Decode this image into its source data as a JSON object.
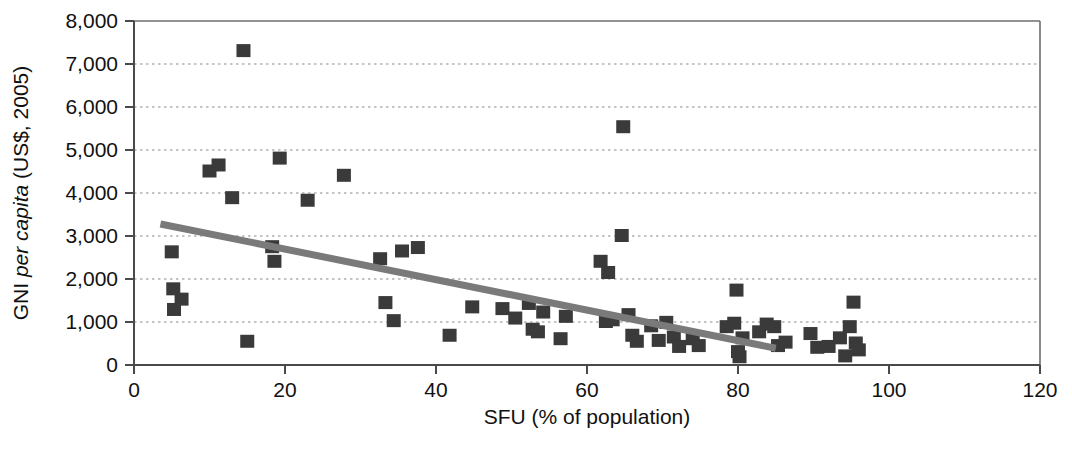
{
  "chart_data": {
    "type": "scatter",
    "title": "",
    "xlabel": "SFU (% of population)",
    "ylabel": "GNI per capita (US$, 2005)",
    "ylabel_parts": [
      {
        "text": "GNI ",
        "style": "normal"
      },
      {
        "text": "per capita",
        "style": "italic"
      },
      {
        "text": " (US$, 2005)",
        "style": "normal"
      }
    ],
    "xlim": [
      0,
      120
    ],
    "ylim": [
      0,
      8000
    ],
    "xticks": [
      0,
      20,
      40,
      60,
      80,
      100,
      120
    ],
    "xtick_labels": [
      "0",
      "20",
      "40",
      "60",
      "80",
      "100",
      "120"
    ],
    "yticks": [
      0,
      1000,
      2000,
      3000,
      4000,
      5000,
      6000,
      7000,
      8000
    ],
    "ytick_labels": [
      "0",
      "1,000",
      "2,000",
      "3,000",
      "4,000",
      "5,000",
      "6,000",
      "7,000",
      "8,000"
    ],
    "grid": "horizontal-dotted",
    "legend": "none",
    "marker": {
      "shape": "square",
      "color": "#3a3a3a",
      "size_px": 14
    },
    "trendline": {
      "type": "linear",
      "color": "#7a7a7a",
      "width_px": 7,
      "x_start": 3.5,
      "y_start": 3280,
      "x_end": 85,
      "y_end": 390
    },
    "points": [
      {
        "x": 5.0,
        "y": 2620
      },
      {
        "x": 5.2,
        "y": 1760
      },
      {
        "x": 5.3,
        "y": 1280
      },
      {
        "x": 6.3,
        "y": 1520
      },
      {
        "x": 10.0,
        "y": 4500
      },
      {
        "x": 11.2,
        "y": 4640
      },
      {
        "x": 13.0,
        "y": 3880
      },
      {
        "x": 14.5,
        "y": 7300
      },
      {
        "x": 15.0,
        "y": 540
      },
      {
        "x": 18.3,
        "y": 2740
      },
      {
        "x": 18.6,
        "y": 2400
      },
      {
        "x": 19.3,
        "y": 4800
      },
      {
        "x": 23.0,
        "y": 3820
      },
      {
        "x": 27.8,
        "y": 4400
      },
      {
        "x": 32.6,
        "y": 2460
      },
      {
        "x": 33.3,
        "y": 1440
      },
      {
        "x": 34.4,
        "y": 1020
      },
      {
        "x": 35.5,
        "y": 2640
      },
      {
        "x": 37.6,
        "y": 2720
      },
      {
        "x": 41.8,
        "y": 680
      },
      {
        "x": 44.8,
        "y": 1340
      },
      {
        "x": 48.8,
        "y": 1300
      },
      {
        "x": 50.5,
        "y": 1080
      },
      {
        "x": 52.3,
        "y": 1420
      },
      {
        "x": 52.8,
        "y": 820
      },
      {
        "x": 53.5,
        "y": 760
      },
      {
        "x": 54.2,
        "y": 1220
      },
      {
        "x": 56.5,
        "y": 600
      },
      {
        "x": 57.2,
        "y": 1120
      },
      {
        "x": 61.8,
        "y": 2400
      },
      {
        "x": 62.8,
        "y": 2140
      },
      {
        "x": 62.5,
        "y": 1000
      },
      {
        "x": 63.4,
        "y": 1040
      },
      {
        "x": 64.6,
        "y": 3000
      },
      {
        "x": 64.8,
        "y": 5530
      },
      {
        "x": 65.5,
        "y": 1160
      },
      {
        "x": 66.0,
        "y": 680
      },
      {
        "x": 66.6,
        "y": 540
      },
      {
        "x": 68.5,
        "y": 900
      },
      {
        "x": 69.5,
        "y": 560
      },
      {
        "x": 70.5,
        "y": 980
      },
      {
        "x": 71.5,
        "y": 640
      },
      {
        "x": 72.2,
        "y": 420
      },
      {
        "x": 74.0,
        "y": 600
      },
      {
        "x": 74.8,
        "y": 440
      },
      {
        "x": 78.5,
        "y": 880
      },
      {
        "x": 79.5,
        "y": 960
      },
      {
        "x": 79.8,
        "y": 1730
      },
      {
        "x": 80.0,
        "y": 300
      },
      {
        "x": 80.2,
        "y": 180
      },
      {
        "x": 80.6,
        "y": 620
      },
      {
        "x": 82.8,
        "y": 760
      },
      {
        "x": 83.8,
        "y": 940
      },
      {
        "x": 84.8,
        "y": 880
      },
      {
        "x": 85.3,
        "y": 440
      },
      {
        "x": 86.3,
        "y": 520
      },
      {
        "x": 89.6,
        "y": 720
      },
      {
        "x": 90.5,
        "y": 400
      },
      {
        "x": 92.0,
        "y": 420
      },
      {
        "x": 93.5,
        "y": 620
      },
      {
        "x": 94.2,
        "y": 200
      },
      {
        "x": 94.8,
        "y": 880
      },
      {
        "x": 95.3,
        "y": 1450
      },
      {
        "x": 95.6,
        "y": 500
      },
      {
        "x": 96.0,
        "y": 340
      }
    ]
  }
}
